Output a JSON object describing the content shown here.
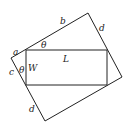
{
  "diagram": {
    "stroke_color": "#222222",
    "background": "#ffffff",
    "outer_rectangle": {
      "points": [
        [
          11,
          58
        ],
        [
          88,
          13
        ],
        [
          122,
          77
        ],
        [
          45,
          121
        ]
      ]
    },
    "inner_rectangle": {
      "x": 26,
      "y": 50,
      "width": 81,
      "height": 35
    },
    "labels": {
      "a": "a",
      "b": "b",
      "d_top": "d",
      "theta_top": "θ",
      "L": "L",
      "c": "c",
      "theta_left": "θ",
      "W": "W",
      "d_bottom": "d"
    }
  }
}
